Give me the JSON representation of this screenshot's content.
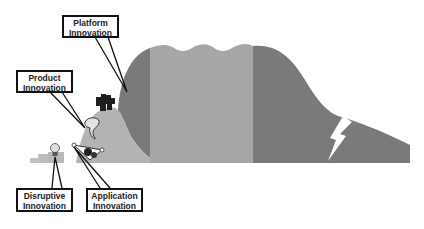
{
  "diagram": {
    "type": "innovation-lifecycle-mountain",
    "colors": {
      "dark_band": "#7a7a7a",
      "light_band": "#a6a6a6",
      "foothill": "#b3b3b3",
      "outline": "#111111",
      "background": "#ffffff"
    },
    "callouts": [
      {
        "id": "platform",
        "line1": "Platform",
        "line2": "Innovation"
      },
      {
        "id": "product",
        "line1": "Product",
        "line2": "Innovation"
      },
      {
        "id": "disruptive",
        "line1": "Disruptive",
        "line2": "Innovation"
      },
      {
        "id": "application",
        "line1": "Application",
        "line2": "Innovation"
      }
    ],
    "icons": [
      "lightbulb-icon",
      "app-cluster-icon",
      "product-icon",
      "platform-blocks-icon",
      "lightning-crack-icon"
    ]
  }
}
